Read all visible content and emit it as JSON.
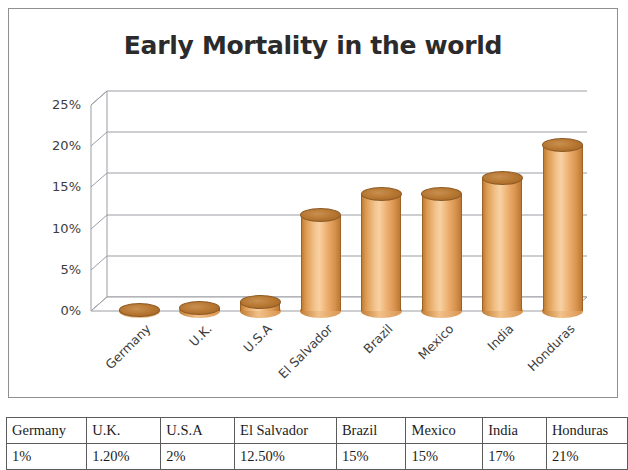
{
  "chart_data": {
    "type": "bar",
    "title": "Early Mortality in the world",
    "xlabel": "",
    "ylabel": "",
    "categories": [
      "Germany",
      "U.K.",
      "U.S.A",
      "El Salvador",
      "Brazil",
      "Mexico",
      "India",
      "Honduras"
    ],
    "values": [
      1,
      1.2,
      2,
      12.5,
      15,
      15,
      17,
      21
    ],
    "value_labels": [
      "1%",
      "1.20%",
      "2%",
      "12.50%",
      "15%",
      "15%",
      "17%",
      "21%"
    ],
    "ylim": [
      0,
      25
    ],
    "y_ticks": [
      0,
      5,
      10,
      15,
      20,
      25
    ],
    "y_tick_labels": [
      "0%",
      "5%",
      "10%",
      "15%",
      "20%",
      "25%"
    ],
    "grid": true,
    "legend": false,
    "style": "3d-cylinder",
    "series_color": "#eeb274",
    "series_top_color": "#b5752f"
  },
  "table": {
    "headers": [
      "Germany",
      "U.K.",
      "U.S.A",
      "El Salvador",
      "Brazil",
      "Mexico",
      "India",
      "Honduras"
    ],
    "values": [
      "1%",
      "1.20%",
      "2%",
      "12.50%",
      "15%",
      "15%",
      "17%",
      "21%"
    ]
  }
}
